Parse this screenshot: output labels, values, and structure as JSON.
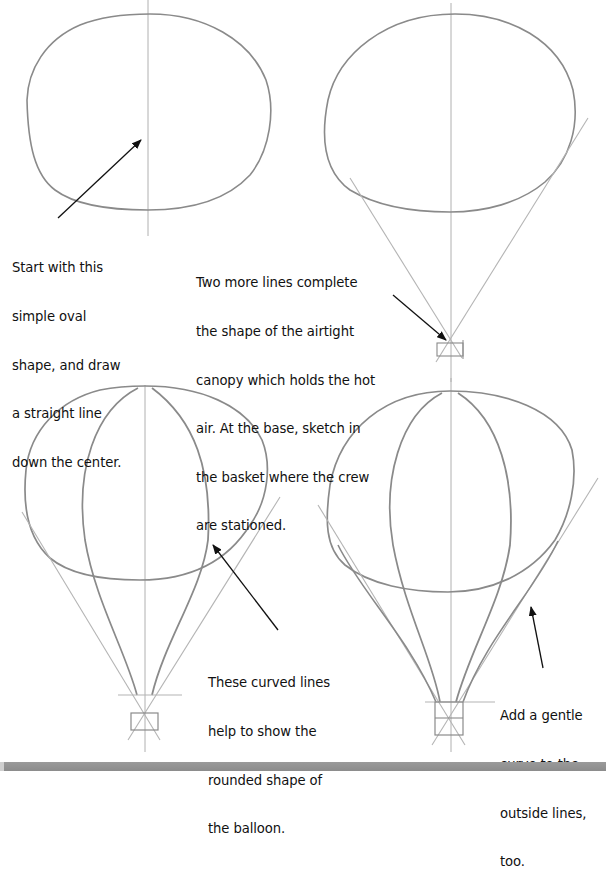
{
  "steps": [
    {
      "id": 1,
      "caption_lines": [
        "Start with this",
        "simple oval",
        "shape, and draw",
        "a straight line",
        "down the center."
      ]
    },
    {
      "id": 2,
      "caption_lines": [
        "Two more lines complete",
        "the shape of the airtight",
        "canopy which holds the hot",
        "air. At the base, sketch in",
        "the basket where the crew",
        "are stationed."
      ]
    },
    {
      "id": 3,
      "caption_lines": [
        "These curved lines",
        "help to show the",
        "rounded shape of",
        "the balloon."
      ]
    },
    {
      "id": 4,
      "caption_lines": [
        "Add a gentle",
        "curve to the",
        "outside lines,",
        "too."
      ]
    }
  ],
  "colors": {
    "pencil": "#8a8a8a",
    "guide": "#b4b4b4",
    "arrow": "#111111",
    "footer_bar": "#939393"
  }
}
